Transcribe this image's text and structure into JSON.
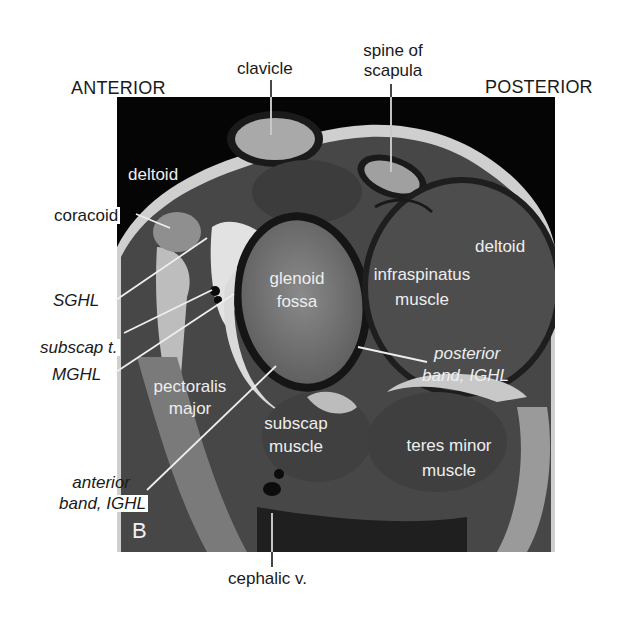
{
  "figure": {
    "panel_letter": "B",
    "orientation": {
      "left": "ANTERIOR",
      "right": "POSTERIOR"
    },
    "outer_labels": {
      "clavicle": "clavicle",
      "spine_of_scapula_line1": "spine of",
      "spine_of_scapula_line2": "scapula",
      "coracoid": "coracoid",
      "sghl": "SGHL",
      "subscap_tendon": "subscap t.",
      "mghl": "MGHL",
      "anterior_band_line1": "anterior",
      "anterior_band_line2": "band, IGHL",
      "cephalic_vein": "cephalic v."
    },
    "inner_labels": {
      "deltoid_anterior": "deltoid",
      "deltoid_posterior": "deltoid",
      "glenoid_line1": "glenoid",
      "glenoid_line2": "fossa",
      "infraspinatus_line1": "infraspinatus",
      "infraspinatus_line2": "muscle",
      "posterior_band_line1": "posterior",
      "posterior_band_line2": "band, IGHL",
      "pectoralis_line1": "pectoralis",
      "pectoralis_line2": "major",
      "subscap_line1": "subscap",
      "subscap_line2": "muscle",
      "teres_line1": "teres minor",
      "teres_line2": "muscle"
    },
    "colors": {
      "background": "#ffffff",
      "image_bg": "#050505",
      "muscle": "#4a4a4a",
      "bone": "#8c8c8c",
      "fat": "#d8d8d8",
      "label_dark": "#1a1a1a",
      "label_light": "#eeeeee"
    }
  }
}
